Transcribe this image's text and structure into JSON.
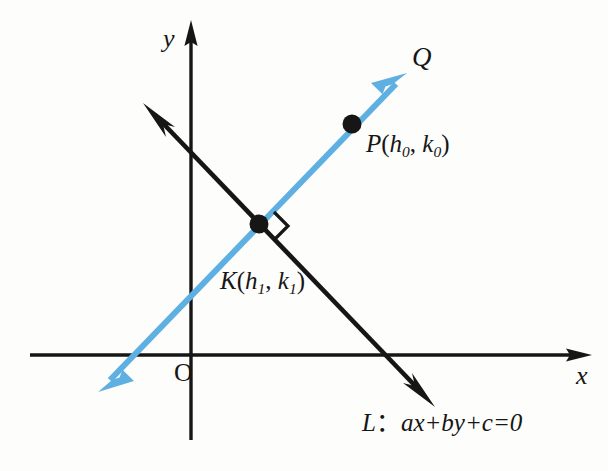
{
  "figure": {
    "type": "geometry-diagram",
    "background_color": "#fdfdfb",
    "axes": {
      "x_label": "x",
      "y_label": "y",
      "origin_label": "O",
      "color": "#161616",
      "origin_px": [
        191,
        355
      ],
      "x_range_px": [
        30,
        590
      ],
      "y_range_px": [
        22,
        440
      ]
    },
    "lines": [
      {
        "name": "line-L",
        "label": "L：ax＋by＋c＝0",
        "label_parts": {
          "name": "L",
          "colon": "：",
          "equation": "ax+by+c=0"
        },
        "color": "#161616",
        "from_px": [
          145,
          105
        ],
        "to_px": [
          433,
          405
        ],
        "arrows": "both"
      },
      {
        "name": "line-Q",
        "label": "Q",
        "color": "#5eb0e2",
        "from_px": [
          100,
          390
        ],
        "to_px": [
          405,
          75
        ],
        "arrows": "both"
      }
    ],
    "points": [
      {
        "name": "point-P",
        "label": "P(h0, k0)",
        "label_parts": {
          "letter": "P",
          "x": "h",
          "x_sub": "0",
          "y": "k",
          "y_sub": "0"
        },
        "position_px": [
          352,
          124
        ],
        "color": "#161616"
      },
      {
        "name": "point-K",
        "label": "K(h1, k1)",
        "label_parts": {
          "letter": "K",
          "x": "h",
          "x_sub": "1",
          "y": "k",
          "y_sub": "1"
        },
        "position_px": [
          259,
          224
        ],
        "color": "#161616"
      }
    ],
    "markers": [
      {
        "name": "right-angle-marker",
        "at_px": [
          259,
          224
        ],
        "meaning": "line Q is perpendicular to line L at K"
      }
    ],
    "colors": {
      "ink": "#161616",
      "accent_blue": "#5eb0e2"
    }
  }
}
